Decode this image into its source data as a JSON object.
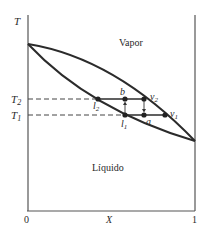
{
  "diagram": {
    "y_axis_label": "T",
    "x_axis_label": "X",
    "x_tick_start": "0",
    "x_tick_end": "1",
    "region_vapor": "Vapor",
    "region_liquid": "Líquido",
    "temp_labels": {
      "T2_main": "T",
      "T2_sub": "2",
      "T1_main": "T",
      "T1_sub": "1"
    },
    "points": {
      "l2": {
        "main": "l",
        "sub": "2"
      },
      "b": {
        "main": "b"
      },
      "v2": {
        "main": "v",
        "sub": "2"
      },
      "l1": {
        "main": "l",
        "sub": "1"
      },
      "a": {
        "main": "a"
      },
      "v1": {
        "main": "v",
        "sub": "1"
      }
    },
    "colors": {
      "line": "#2b2b2b",
      "axis": "#555555",
      "dash": "#444444"
    }
  }
}
